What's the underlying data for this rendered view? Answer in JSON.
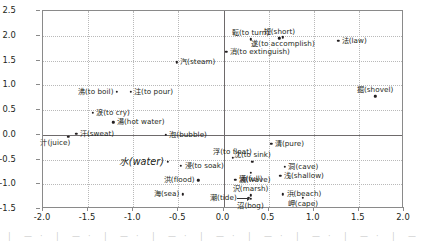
{
  "chart_data": {
    "type": "scatter",
    "title": "",
    "xlabel": "",
    "ylabel": "",
    "xlim": [
      -2.0,
      2.0
    ],
    "ylim": [
      -1.5,
      2.5
    ],
    "xticks": [
      "-2.0",
      "-1.5",
      "-1.0",
      "-0.5",
      "0.0",
      "0.5",
      "1.0",
      "1.5",
      "2.0"
    ],
    "xtick_values": [
      -2.0,
      -1.5,
      -1.0,
      -0.5,
      0.0,
      0.5,
      1.0,
      1.5,
      2.0
    ],
    "yticks": [
      "2.5",
      "2.0",
      "1.5",
      "1.0",
      "0.5",
      "0.0",
      "-0.5",
      "-1.0",
      "-1.5"
    ],
    "ytick_values": [
      2.5,
      2.0,
      1.5,
      1.0,
      0.5,
      0.0,
      -0.5,
      -1.0,
      -1.5
    ],
    "grid": true,
    "legend": "none",
    "zero_axes": true,
    "points": [
      {
        "label": "転(to turn)",
        "x": 0.3,
        "y": 1.93,
        "pos": "above-center"
      },
      {
        "label": "短(short)",
        "x": 0.62,
        "y": 1.95,
        "pos": "above-center"
      },
      {
        "label": "遂(to accomplish)",
        "x": 0.66,
        "y": 1.97,
        "pos": "below-center"
      },
      {
        "label": "法(law)",
        "x": 1.27,
        "y": 1.9,
        "pos": "right"
      },
      {
        "label": "消(to extinguish)",
        "x": 0.03,
        "y": 1.68,
        "pos": "right"
      },
      {
        "label": "汽(steam)",
        "x": -0.52,
        "y": 1.46,
        "pos": "right"
      },
      {
        "label": "掘(shovel)",
        "x": 1.68,
        "y": 0.78,
        "pos": "above-center"
      },
      {
        "label": "沸(to boil)",
        "x": -1.18,
        "y": 0.87,
        "pos": "left"
      },
      {
        "label": "注(to pour)",
        "x": -1.03,
        "y": 0.87,
        "pos": "right"
      },
      {
        "label": "涙(to cry)",
        "x": -1.45,
        "y": 0.44,
        "pos": "right"
      },
      {
        "label": "湯(hot water)",
        "x": -1.22,
        "y": 0.25,
        "pos": "right"
      },
      {
        "label": "汗(sweat)",
        "x": -1.63,
        "y": 0.02,
        "pos": "right"
      },
      {
        "label": "汁(juice)",
        "x": -1.72,
        "y": -0.04,
        "pos": "below-left"
      },
      {
        "label": "泡(bubble)",
        "x": -0.64,
        "y": 0.0,
        "pos": "right"
      },
      {
        "label": "清(pure)",
        "x": 0.53,
        "y": -0.18,
        "pos": "right"
      },
      {
        "label": "水(water)",
        "x": -0.62,
        "y": -0.55,
        "pos": "left",
        "style": "big"
      },
      {
        "label": "浮(to float)",
        "x": 0.1,
        "y": -0.47,
        "pos": "above-center"
      },
      {
        "label": "沈(to sink)",
        "x": 0.32,
        "y": -0.55,
        "pos": "above-center"
      },
      {
        "label": "浸(to soak)",
        "x": -0.47,
        "y": -0.63,
        "pos": "right"
      },
      {
        "label": "洞(cave)",
        "x": 0.68,
        "y": -0.65,
        "pos": "right"
      },
      {
        "label": "満(full)",
        "x": 0.3,
        "y": -0.77,
        "pos": "below-center"
      },
      {
        "label": "浅(shallow)",
        "x": 0.63,
        "y": -0.83,
        "pos": "right"
      },
      {
        "label": "洪(flood)",
        "x": -0.28,
        "y": -0.92,
        "pos": "left"
      },
      {
        "label": "波(wave)",
        "x": 0.13,
        "y": -0.91,
        "pos": "right"
      },
      {
        "label": "海(sea)",
        "x": -0.45,
        "y": -1.2,
        "pos": "left"
      },
      {
        "label": "潮(tide)",
        "x": 0.28,
        "y": -1.27,
        "pos": "left-arrow"
      },
      {
        "label": "沢(marsh)",
        "x": 0.3,
        "y": -1.22,
        "pos": "above-center"
      },
      {
        "label": "沼(bog)",
        "x": 0.3,
        "y": -1.3,
        "pos": "below-center"
      },
      {
        "label": "浜(beach)",
        "x": 0.66,
        "y": -1.2,
        "pos": "right"
      },
      {
        "label": "岬(cape)",
        "x": 0.88,
        "y": -1.27,
        "pos": "below-center"
      }
    ]
  }
}
